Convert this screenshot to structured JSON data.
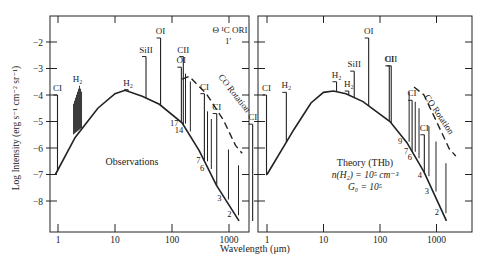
{
  "chart_data": [
    {
      "type": "line",
      "panel": "left",
      "title": "Observations",
      "source_label": "Θ ¹C ORI",
      "source_sublabel": "1'",
      "xlabel": "Wavelength (μm)",
      "ylabel": "Log Intensity (erg s⁻¹ cm⁻² sr⁻¹)",
      "xscale": "log",
      "xticks": [
        "1",
        "10",
        "100",
        "1000"
      ],
      "yticks": [
        -2,
        -3,
        -4,
        -5,
        -6,
        -7,
        -8
      ],
      "ylim": [
        -8.5,
        -1.0
      ],
      "continuum": {
        "name": "dust continuum",
        "points": [
          [
            0.9,
            -7.0
          ],
          [
            2,
            -5.6
          ],
          [
            5,
            -4.5
          ],
          [
            10,
            -3.95
          ],
          [
            15,
            -3.82
          ],
          [
            30,
            -4.05
          ],
          [
            60,
            -4.35
          ],
          [
            150,
            -5.05
          ],
          [
            300,
            -6.1
          ],
          [
            600,
            -7.4
          ],
          [
            1500,
            -8.75
          ]
        ]
      },
      "co_rotation": {
        "label": "CO Rotation",
        "style": "dashed",
        "points": [
          [
            150,
            -3.4
          ],
          [
            200,
            -3.3
          ],
          [
            400,
            -3.95
          ],
          [
            800,
            -4.95
          ],
          [
            1300,
            -5.9
          ],
          [
            1700,
            -6.2
          ]
        ]
      },
      "lines": [
        {
          "label": "CI",
          "wavelength": 0.98,
          "peak": -4.0
        },
        {
          "label": "H₂",
          "wavelength": 2.2,
          "peak": -3.65,
          "note": "cluster of near-IR lines"
        },
        {
          "label": "H₂",
          "wavelength": 17,
          "peak": -3.8
        },
        {
          "label": "SiII",
          "wavelength": 35,
          "peak": -2.55
        },
        {
          "label": "OI",
          "wavelength": 63,
          "peak": -1.85
        },
        {
          "label": "OI",
          "wavelength": 146,
          "peak": -2.95
        },
        {
          "label": "CII",
          "wavelength": 158,
          "peak": -2.55
        },
        {
          "label": "CI",
          "wavelength": 370,
          "peak": -3.95
        },
        {
          "label": "CI",
          "wavelength": 609,
          "peak": -4.7
        },
        {
          "label": "CI",
          "wavelength": 2600,
          "peak": -5.1
        }
      ],
      "co_lines": [
        {
          "J": "17",
          "wavelength": 153
        },
        {
          "J": "14",
          "wavelength": 186
        },
        {
          "J": "7",
          "wavelength": 372
        },
        {
          "J": "6",
          "wavelength": 434
        },
        {
          "J": "3",
          "wavelength": 867
        },
        {
          "J": "2",
          "wavelength": 1300
        }
      ]
    },
    {
      "type": "line",
      "panel": "right",
      "title": "Theory (THb)",
      "params": [
        "n(H₂) = 10⁵ cm⁻³",
        "G₀ = 10⁵"
      ],
      "xlabel": "Wavelength (μm)",
      "xscale": "log",
      "xticks": [
        "1",
        "10",
        "100",
        "1000"
      ],
      "yticks": [
        -2,
        -3,
        -4,
        -5,
        -6,
        -7,
        -8
      ],
      "ylim": [
        -8.5,
        -1.0
      ],
      "continuum": {
        "name": "dust continuum",
        "points": [
          [
            1,
            -7.0
          ],
          [
            3,
            -5.3
          ],
          [
            6,
            -4.3
          ],
          [
            10,
            -3.9
          ],
          [
            15,
            -3.85
          ],
          [
            25,
            -3.95
          ],
          [
            50,
            -4.25
          ],
          [
            150,
            -5.0
          ],
          [
            300,
            -5.8
          ],
          [
            600,
            -6.9
          ],
          [
            1500,
            -8.75
          ]
        ]
      },
      "co_rotation": {
        "label": "CO Rotation",
        "style": "dashed",
        "points": [
          [
            400,
            -3.7
          ],
          [
            600,
            -4.0
          ],
          [
            1000,
            -5.0
          ],
          [
            1700,
            -6.05
          ],
          [
            2200,
            -6.3
          ]
        ]
      },
      "lines": [
        {
          "label": "CI",
          "wavelength": 0.98,
          "peak": -4.0
        },
        {
          "label": "H₂",
          "wavelength": 2.2,
          "peak": -3.9
        },
        {
          "label": "H₂",
          "wavelength": 17,
          "peak": -3.5
        },
        {
          "label": "H₂",
          "wavelength": 28,
          "peak": -3.85
        },
        {
          "label": "SiII",
          "wavelength": 35,
          "peak": -3.1
        },
        {
          "label": "OI",
          "wavelength": 63,
          "peak": -1.85
        },
        {
          "label": "OI",
          "wavelength": 146,
          "peak": -2.9
        },
        {
          "label": "CII",
          "wavelength": 158,
          "peak": -2.9
        },
        {
          "label": "CI",
          "wavelength": 370,
          "peak": -4.2
        },
        {
          "label": "CI",
          "wavelength": 609,
          "peak": -5.5
        }
      ],
      "co_lines": [
        {
          "J": "9",
          "wavelength": 290
        },
        {
          "J": "7",
          "wavelength": 372
        },
        {
          "J": "6",
          "wavelength": 434
        },
        {
          "J": "4",
          "wavelength": 650
        },
        {
          "J": "3",
          "wavelength": 867
        },
        {
          "J": "2",
          "wavelength": 1300
        }
      ]
    }
  ],
  "figure": {
    "ylabel": "Log Intensity (erg s⁻¹ cm⁻² sr⁻¹)",
    "xlabel": "Wavelength (μm)",
    "left": {
      "title": "Observations",
      "source": "Θ ¹C ORI",
      "source_sub": "1'",
      "xtick_labels": [
        "1",
        "10",
        "100",
        "1000"
      ],
      "co_label": "CO Rotation"
    },
    "right": {
      "title": "Theory (THb)",
      "param1": "n(H₂) = 10⁵ cm⁻³",
      "param2": "G₀ = 10⁵",
      "xtick_labels": [
        "1",
        "10",
        "100",
        "1000"
      ],
      "co_label": "CO Rotation"
    },
    "ytick_labels": [
      "−2",
      "−3",
      "−4",
      "−5",
      "−6",
      "−7",
      "−8"
    ]
  }
}
